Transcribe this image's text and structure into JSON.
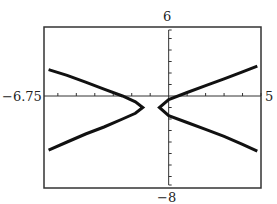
{
  "chart_data": {
    "type": "line",
    "title": "",
    "xlabel": "",
    "ylabel": "",
    "xlim": [
      -6.75,
      5
    ],
    "ylim": [
      -8,
      6
    ],
    "grid": false,
    "legend": null,
    "tick_labels": {
      "x_min": "-6.75",
      "x_max": "5",
      "y_max": "6",
      "y_min": "-8"
    },
    "x_ticks": [
      -6,
      -5,
      -4,
      -3,
      -2,
      -1,
      1,
      2,
      3,
      4,
      5
    ],
    "y_ticks": [
      -7,
      -6,
      -5,
      -4,
      -3,
      -2,
      -1,
      1,
      2,
      3,
      4,
      5
    ],
    "series": [
      {
        "name": "left-branch",
        "x": [
          -6.5,
          -5.5,
          -4.5,
          -3.5,
          -2.5,
          -1.8,
          -1.4,
          -1.8,
          -2.5,
          -3.5,
          -4.5,
          -5.5,
          -6.5
        ],
        "y": [
          2.3,
          1.8,
          1.2,
          0.6,
          0.0,
          -0.5,
          -1.0,
          -1.5,
          -2.0,
          -2.7,
          -3.3,
          -4.0,
          -4.7
        ]
      },
      {
        "name": "right-branch",
        "x": [
          4.8,
          4.0,
          3.0,
          2.0,
          1.0,
          0.0,
          -0.5,
          0.0,
          1.0,
          2.0,
          3.0,
          4.0,
          4.8
        ],
        "y": [
          2.6,
          2.1,
          1.5,
          0.9,
          0.3,
          -0.3,
          -1.0,
          -1.7,
          -2.3,
          -2.9,
          -3.5,
          -4.2,
          -4.8
        ]
      }
    ]
  },
  "labels": {
    "x_min": "−6.75",
    "x_max": "5",
    "y_max": "6",
    "y_min": "−8"
  },
  "colors": {
    "frame": "#333333",
    "curve": "#111111",
    "axis": "#333333"
  }
}
